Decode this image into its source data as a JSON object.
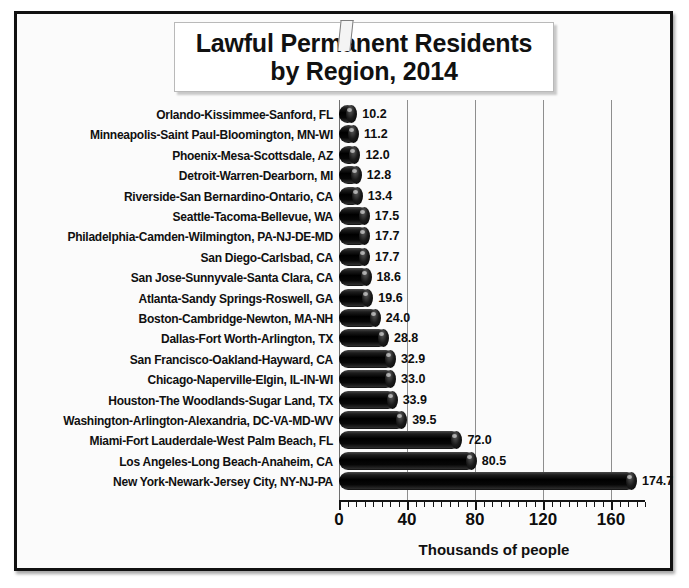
{
  "figure": {
    "title_line1": "Lawful Permanent Residents",
    "title_line2": "by Region, 2014"
  },
  "chart_data": {
    "type": "bar",
    "orientation": "horizontal",
    "title": "Lawful Permanent Residents by Region, 2014",
    "xlabel": "Thousands of people",
    "ylabel": "",
    "xlim": [
      0,
      180
    ],
    "xticks": [
      0,
      40,
      80,
      120,
      160
    ],
    "xtick_labels": [
      "0",
      "40",
      "80",
      "120",
      "160"
    ],
    "minor_tick_step": 5,
    "grid": "vertical",
    "legend": null,
    "bar_color": "#0a0a0a",
    "background_color": "#fbfbfb",
    "categories": [
      "Orlando-Kissimmee-Sanford, FL",
      "Minneapolis-Saint Paul-Bloomington, MN-WI",
      "Phoenix-Mesa-Scottsdale, AZ",
      "Detroit-Warren-Dearborn, MI",
      "Riverside-San Bernardino-Ontario, CA",
      "Seattle-Tacoma-Bellevue, WA",
      "Philadelphia-Camden-Wilmington, PA-NJ-DE-MD",
      "San Diego-Carlsbad, CA",
      "San Jose-Sunnyvale-Santa Clara, CA",
      "Atlanta-Sandy Springs-Roswell, GA",
      "Boston-Cambridge-Newton, MA-NH",
      "Dallas-Fort Worth-Arlington, TX",
      "San Francisco-Oakland-Hayward, CA",
      "Chicago-Naperville-Elgin, IL-IN-WI",
      "Houston-The Woodlands-Sugar Land, TX",
      "Washington-Arlington-Alexandria, DC-VA-MD-WV",
      "Miami-Fort Lauderdale-West Palm Beach, FL",
      "Los Angeles-Long Beach-Anaheim, CA",
      "New York-Newark-Jersey City, NY-NJ-PA"
    ],
    "values": [
      10.2,
      11.2,
      12.0,
      12.8,
      13.4,
      17.5,
      17.7,
      17.7,
      18.6,
      19.6,
      24.0,
      28.8,
      32.9,
      33.0,
      33.9,
      39.5,
      72.0,
      80.5,
      174.7
    ],
    "value_labels": [
      "10.2",
      "11.2",
      "12.0",
      "12.8",
      "13.4",
      "17.5",
      "17.7",
      "17.7",
      "18.6",
      "19.6",
      "24.0",
      "28.8",
      "32.9",
      "33.0",
      "33.9",
      "39.5",
      "72.0",
      "80.5",
      "174.7"
    ]
  }
}
